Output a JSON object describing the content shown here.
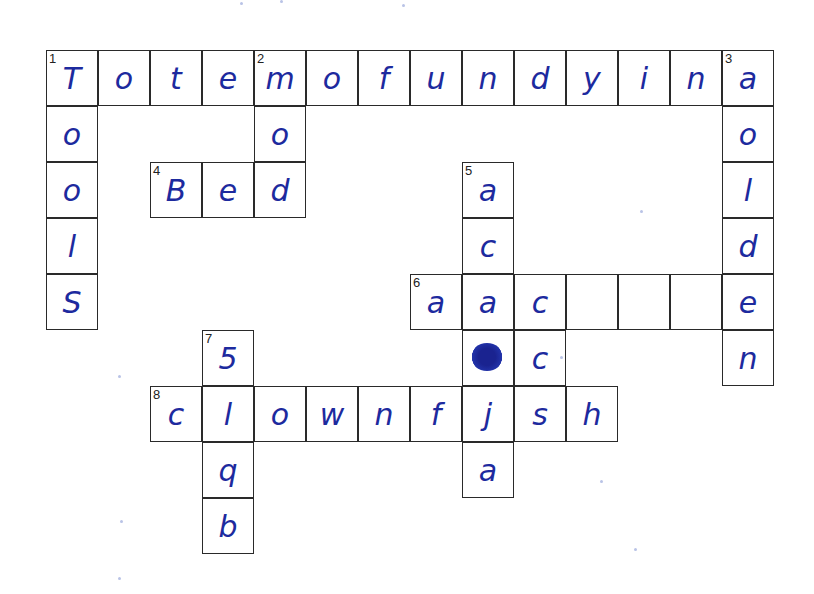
{
  "puzzle": {
    "type": "crossword",
    "ink_color": "#1d2a9e",
    "grid_line_color": "#2a2a2a",
    "cell_size": {
      "w": 52,
      "h": 56
    },
    "origin": {
      "x": 46,
      "y": 50
    },
    "cells": [
      {
        "r": 0,
        "c": 0,
        "num": "1",
        "ch": "T"
      },
      {
        "r": 0,
        "c": 1,
        "ch": "o"
      },
      {
        "r": 0,
        "c": 2,
        "ch": "t"
      },
      {
        "r": 0,
        "c": 3,
        "ch": "e"
      },
      {
        "r": 0,
        "c": 4,
        "num": "2",
        "ch": "m"
      },
      {
        "r": 0,
        "c": 5,
        "ch": "o"
      },
      {
        "r": 0,
        "c": 6,
        "ch": "f"
      },
      {
        "r": 0,
        "c": 7,
        "ch": "u"
      },
      {
        "r": 0,
        "c": 8,
        "ch": "n"
      },
      {
        "r": 0,
        "c": 9,
        "ch": "d"
      },
      {
        "r": 0,
        "c": 10,
        "ch": "y"
      },
      {
        "r": 0,
        "c": 11,
        "ch": "i"
      },
      {
        "r": 0,
        "c": 12,
        "ch": "n"
      },
      {
        "r": 0,
        "c": 13,
        "num": "3",
        "ch": "a"
      },
      {
        "r": 1,
        "c": 0,
        "ch": "o"
      },
      {
        "r": 1,
        "c": 4,
        "ch": "o"
      },
      {
        "r": 1,
        "c": 13,
        "ch": "o"
      },
      {
        "r": 2,
        "c": 0,
        "ch": "o"
      },
      {
        "r": 2,
        "c": 2,
        "num": "4",
        "ch": "B"
      },
      {
        "r": 2,
        "c": 3,
        "ch": "e"
      },
      {
        "r": 2,
        "c": 4,
        "ch": "d"
      },
      {
        "r": 2,
        "c": 8,
        "num": "5",
        "ch": "a"
      },
      {
        "r": 2,
        "c": 13,
        "ch": "l"
      },
      {
        "r": 3,
        "c": 0,
        "ch": "l"
      },
      {
        "r": 3,
        "c": 8,
        "ch": "c"
      },
      {
        "r": 3,
        "c": 13,
        "ch": "d"
      },
      {
        "r": 4,
        "c": 0,
        "ch": "S"
      },
      {
        "r": 4,
        "c": 7,
        "num": "6",
        "ch": "a"
      },
      {
        "r": 4,
        "c": 8,
        "ch": "a"
      },
      {
        "r": 4,
        "c": 9,
        "ch": "c"
      },
      {
        "r": 4,
        "c": 10,
        "ch": ""
      },
      {
        "r": 4,
        "c": 11,
        "ch": ""
      },
      {
        "r": 4,
        "c": 12,
        "ch": ""
      },
      {
        "r": 4,
        "c": 13,
        "ch": "e"
      },
      {
        "r": 5,
        "c": 3,
        "num": "7",
        "ch": "5"
      },
      {
        "r": 5,
        "c": 8,
        "ch": "",
        "scribble": true
      },
      {
        "r": 5,
        "c": 9,
        "ch": "c"
      },
      {
        "r": 5,
        "c": 13,
        "ch": "n"
      },
      {
        "r": 6,
        "c": 2,
        "num": "8",
        "ch": "c"
      },
      {
        "r": 6,
        "c": 3,
        "ch": "l"
      },
      {
        "r": 6,
        "c": 4,
        "ch": "o"
      },
      {
        "r": 6,
        "c": 5,
        "ch": "w"
      },
      {
        "r": 6,
        "c": 6,
        "ch": "n"
      },
      {
        "r": 6,
        "c": 7,
        "ch": "f"
      },
      {
        "r": 6,
        "c": 8,
        "ch": "j"
      },
      {
        "r": 6,
        "c": 9,
        "ch": "s"
      },
      {
        "r": 6,
        "c": 10,
        "ch": "h"
      },
      {
        "r": 7,
        "c": 3,
        "ch": "q"
      },
      {
        "r": 7,
        "c": 8,
        "ch": "a"
      },
      {
        "r": 8,
        "c": 3,
        "ch": "b"
      }
    ],
    "answers": {
      "across": [
        {
          "num": "1",
          "text": "Totemofundyina"
        },
        {
          "num": "4",
          "text": "Bed"
        },
        {
          "num": "6",
          "text": "aac___e"
        },
        {
          "num": "8",
          "text": "clownfjsh"
        }
      ],
      "down": [
        {
          "num": "1",
          "text": "Tools"
        },
        {
          "num": "2",
          "text": "mod"
        },
        {
          "num": "3",
          "text": "aolden"
        },
        {
          "num": "5",
          "text": "aca?ja"
        },
        {
          "num": "7",
          "text": "5lqb"
        }
      ]
    }
  }
}
